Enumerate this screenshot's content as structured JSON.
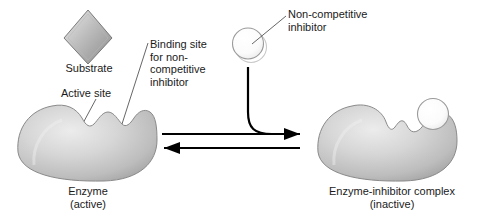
{
  "diagram": {
    "background_color": "#ffffff",
    "text_color": "#1a1a1a"
  },
  "labels": {
    "substrate": "Substrate",
    "active_site": "Active site",
    "binding_site": "Binding site\nfor non-\ncompetitive\ninhibitor",
    "noncompetitive_inhibitor": "Non-competitive\ninhibitor",
    "enzyme_active": "Enzyme\n(active)",
    "enzyme_inhibitor_complex": "Enzyme-inhibitor complex\n(inactive)"
  },
  "shapes": {
    "substrate_diamond": {
      "name": "substrate",
      "fill_light": "#e2e2e2",
      "fill_dark": "#8f8f8f",
      "outline": "#6e6e6e"
    },
    "inhibitor_circle": {
      "name": "non-competitive-inhibitor",
      "fill": "#ffffff",
      "outline": "#9a9a9a"
    },
    "enzyme_left": {
      "name": "enzyme-active",
      "fill_light": "#e4e4e4",
      "fill_mid": "#c6c6c6",
      "fill_dark": "#a4a4a4",
      "outline": "#8a8a8a",
      "state": "active"
    },
    "enzyme_right": {
      "name": "enzyme-inhibitor-complex",
      "fill_light": "#e4e4e4",
      "fill_mid": "#c6c6c6",
      "fill_dark": "#a4a4a4",
      "outline": "#8a8a8a",
      "state": "inactive"
    }
  },
  "arrows": {
    "forward": {
      "name": "forward-reaction-arrow",
      "direction": "right",
      "color": "#000000"
    },
    "reverse": {
      "name": "reverse-reaction-arrow",
      "direction": "left",
      "color": "#000000"
    },
    "inhibitor_path": {
      "name": "inhibitor-binding-path",
      "color": "#000000"
    }
  },
  "leader_lines": {
    "color": "#555555",
    "items": [
      "active-site-leader",
      "binding-site-leader",
      "inhibitor-leader"
    ]
  }
}
